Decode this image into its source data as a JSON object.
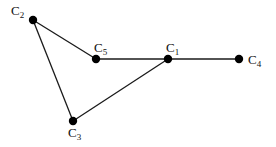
{
  "diagram": {
    "type": "graph",
    "nodes": [
      {
        "id": "C1",
        "letter": "C",
        "sub": "1",
        "x": 168,
        "y": 59,
        "label_x": 166,
        "label_y": 52
      },
      {
        "id": "C2",
        "letter": "C",
        "sub": "2",
        "x": 33,
        "y": 20,
        "label_x": 11,
        "label_y": 15
      },
      {
        "id": "C3",
        "letter": "C",
        "sub": "3",
        "x": 73,
        "y": 121,
        "label_x": 68,
        "label_y": 137
      },
      {
        "id": "C4",
        "letter": "C",
        "sub": "4",
        "x": 239,
        "y": 59,
        "label_x": 248,
        "label_y": 64
      },
      {
        "id": "C5",
        "letter": "C",
        "sub": "5",
        "x": 96,
        "y": 59,
        "label_x": 94,
        "label_y": 52
      }
    ],
    "edges": [
      {
        "from": "C2",
        "to": "C5"
      },
      {
        "from": "C5",
        "to": "C1"
      },
      {
        "from": "C1",
        "to": "C4"
      },
      {
        "from": "C2",
        "to": "C3"
      },
      {
        "from": "C3",
        "to": "C1"
      }
    ],
    "colors": {
      "node": "#000000",
      "edge": "#1a1a1a",
      "label": "#111111",
      "background": "#ffffff"
    }
  }
}
